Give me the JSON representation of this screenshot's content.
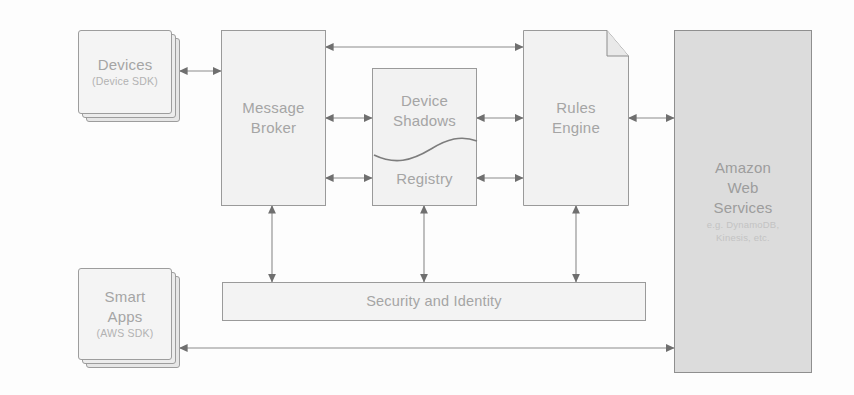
{
  "diagram": {
    "background_color": "#fdfdfd",
    "line_color": "#8b8b8b",
    "text_color": "#a5a5a5",
    "node_fill": "#f2f2f2",
    "aws_fill": "#dcdcdc"
  },
  "nodes": {
    "devices": {
      "title": "Devices",
      "subtitle": "(Device SDK)",
      "shape": "stacked-card"
    },
    "message_broker": {
      "line1": "Message",
      "line2": "Broker",
      "shape": "rectangle"
    },
    "device_shadows": {
      "line1": "Device",
      "line2": "Shadows",
      "shape": "split-top"
    },
    "registry": {
      "title": "Registry",
      "shape": "split-bottom"
    },
    "rules_engine": {
      "line1": "Rules",
      "line2": "Engine",
      "shape": "folded-corner-document"
    },
    "amazon_web_services": {
      "line1": "Amazon",
      "line2": "Web",
      "line3": "Services",
      "subtitle1": "e.g. DynamoDB,",
      "subtitle2": "Kinesis, etc.",
      "shape": "rectangle"
    },
    "smart_apps": {
      "line1": "Smart",
      "line2": "Apps",
      "subtitle": "(AWS SDK)",
      "shape": "stacked-card"
    },
    "security_identity": {
      "title": "Security and Identity",
      "shape": "wide-bar"
    }
  },
  "connections": [
    {
      "id": "devices-broker",
      "from": "devices",
      "to": "message_broker",
      "style": "bidirectional"
    },
    {
      "id": "broker-rules-top",
      "from": "message_broker",
      "to": "rules_engine",
      "style": "bidirectional"
    },
    {
      "id": "broker-shadows",
      "from": "message_broker",
      "to": "device_shadows",
      "style": "bidirectional"
    },
    {
      "id": "shadows-rules",
      "from": "device_shadows",
      "to": "rules_engine",
      "style": "bidirectional"
    },
    {
      "id": "broker-registry",
      "from": "message_broker",
      "to": "registry",
      "style": "bidirectional"
    },
    {
      "id": "registry-rules",
      "from": "registry",
      "to": "rules_engine",
      "style": "bidirectional"
    },
    {
      "id": "rules-aws",
      "from": "rules_engine",
      "to": "amazon_web_services",
      "style": "bidirectional"
    },
    {
      "id": "broker-security",
      "from": "message_broker",
      "to": "security_identity",
      "style": "bidirectional"
    },
    {
      "id": "shadows-security",
      "from": "device_shadows",
      "to": "security_identity",
      "style": "bidirectional"
    },
    {
      "id": "rules-security",
      "from": "rules_engine",
      "to": "security_identity",
      "style": "bidirectional"
    },
    {
      "id": "smartapps-aws",
      "from": "smart_apps",
      "to": "amazon_web_services",
      "style": "bidirectional"
    }
  ]
}
